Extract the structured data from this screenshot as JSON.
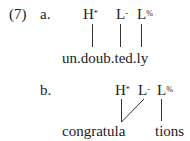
{
  "example": {
    "number": "(7)",
    "a": {
      "label": "a.",
      "tones": [
        {
          "base": "H",
          "mark": "*"
        },
        {
          "base": "L",
          "mark": "-"
        },
        {
          "base": "L",
          "mark": "%"
        }
      ],
      "word": "un.doub.ted.ly"
    },
    "b": {
      "label": "b.",
      "tones": [
        {
          "base": "H",
          "mark": "*"
        },
        {
          "base": "L",
          "mark": "-"
        },
        {
          "base": "L",
          "mark": "%"
        }
      ],
      "word_part1": "congratula",
      "word_part2": "tions"
    }
  }
}
